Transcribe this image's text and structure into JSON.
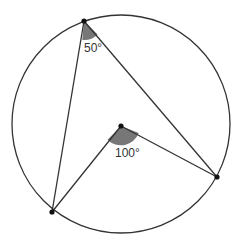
{
  "diagram": {
    "type": "circle-theorem",
    "circle": {
      "cx": 121,
      "cy": 124,
      "r": 109
    },
    "points": {
      "A": {
        "x": 84,
        "y": 21,
        "role": "point on circle (inscribed angle vertex)"
      },
      "B": {
        "x": 52,
        "y": 212,
        "role": "point on circle"
      },
      "C": {
        "x": 217,
        "y": 177,
        "role": "point on circle"
      },
      "O": {
        "x": 121,
        "y": 126,
        "role": "centre of circle"
      }
    },
    "segments": [
      [
        "A",
        "B"
      ],
      [
        "A",
        "C"
      ],
      [
        "O",
        "B"
      ],
      [
        "O",
        "C"
      ]
    ],
    "angles": {
      "inscribed": {
        "vertex": "A",
        "label": "50°",
        "value": 50
      },
      "central": {
        "vertex": "O",
        "label": "100°",
        "value": 100
      }
    },
    "colors": {
      "stroke": "#333333",
      "angle_fill": "#777777",
      "label": "#333333"
    }
  }
}
